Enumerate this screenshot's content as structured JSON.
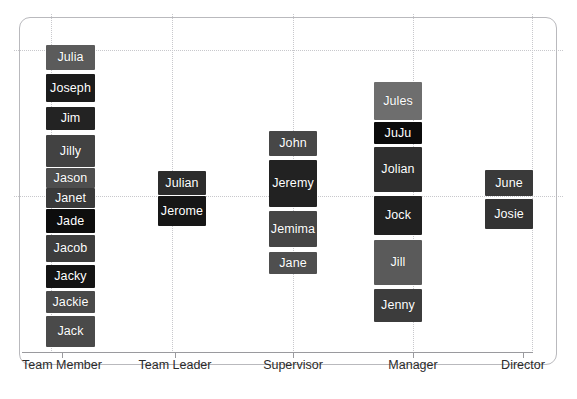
{
  "chart_data": {
    "type": "scatter",
    "title": "",
    "subtitle": "",
    "xlabel": "",
    "ylabel": "",
    "legend": [],
    "grid": true,
    "categories": [
      "Team Member",
      "Team Leader",
      "Supervisor",
      "Manager",
      "Director"
    ],
    "x_tick_positions_px": [
      62,
      175,
      293,
      413,
      523
    ],
    "gridlines": {
      "vertical_px": [
        51,
        172,
        293,
        413,
        532
      ],
      "horizontal_px": [
        50,
        196
      ]
    },
    "point_label_style": "dark filled boxes with white text",
    "series": [
      {
        "name": "Team Member",
        "category": "Team Member",
        "x_px": 71,
        "points": [
          {
            "label": "Julia",
            "x_px": 71,
            "y_px": 58,
            "box": {
              "left": 46,
              "top": 45,
              "width": 49,
              "height": 25
            },
            "color": "#5b5b5b"
          },
          {
            "label": "Joseph",
            "x_px": 71,
            "y_px": 88,
            "box": {
              "left": 46,
              "top": 74,
              "width": 49,
              "height": 28
            },
            "color": "#1c1c1c"
          },
          {
            "label": "Jim",
            "x_px": 71,
            "y_px": 119,
            "box": {
              "left": 46,
              "top": 107,
              "width": 49,
              "height": 23
            },
            "color": "#232323"
          },
          {
            "label": "Jilly",
            "x_px": 71,
            "y_px": 152,
            "box": {
              "left": 46,
              "top": 135,
              "width": 49,
              "height": 32
            },
            "color": "#424242"
          },
          {
            "label": "Jason",
            "x_px": 71,
            "y_px": 178,
            "box": {
              "left": 46,
              "top": 168,
              "width": 49,
              "height": 20
            },
            "color": "#4e4e4e"
          },
          {
            "label": "Janet",
            "x_px": 71,
            "y_px": 197,
            "box": {
              "left": 46,
              "top": 188,
              "width": 49,
              "height": 20
            },
            "color": "#3a3a3a"
          },
          {
            "label": "Jade",
            "x_px": 71,
            "y_px": 221,
            "box": {
              "left": 46,
              "top": 209,
              "width": 49,
              "height": 24
            },
            "color": "#0d0d0d"
          },
          {
            "label": "Jacob",
            "x_px": 71,
            "y_px": 249,
            "box": {
              "left": 46,
              "top": 235,
              "width": 49,
              "height": 27
            },
            "color": "#3d3d3d"
          },
          {
            "label": "Jacky",
            "x_px": 71,
            "y_px": 277,
            "box": {
              "left": 46,
              "top": 265,
              "width": 49,
              "height": 23
            },
            "color": "#141414"
          },
          {
            "label": "Jackie",
            "x_px": 71,
            "y_px": 302,
            "box": {
              "left": 46,
              "top": 291,
              "width": 49,
              "height": 22
            },
            "color": "#4a4a4a"
          },
          {
            "label": "Jack",
            "x_px": 71,
            "y_px": 332,
            "box": {
              "left": 46,
              "top": 316,
              "width": 49,
              "height": 31
            },
            "color": "#4a4a4a"
          }
        ]
      },
      {
        "name": "Team Leader",
        "category": "Team Leader",
        "x_px": 182,
        "points": [
          {
            "label": "Julian",
            "x_px": 182,
            "y_px": 183,
            "box": {
              "left": 158,
              "top": 171,
              "width": 48,
              "height": 24
            },
            "color": "#2c2c2c"
          },
          {
            "label": "Jerome",
            "x_px": 182,
            "y_px": 211,
            "box": {
              "left": 158,
              "top": 196,
              "width": 48,
              "height": 30
            },
            "color": "#161616"
          }
        ]
      },
      {
        "name": "Supervisor",
        "category": "Supervisor",
        "x_px": 293,
        "points": [
          {
            "label": "John",
            "x_px": 293,
            "y_px": 144,
            "box": {
              "left": 269,
              "top": 131,
              "width": 48,
              "height": 25
            },
            "color": "#474747"
          },
          {
            "label": "Jeremy",
            "x_px": 293,
            "y_px": 184,
            "box": {
              "left": 269,
              "top": 160,
              "width": 48,
              "height": 47
            },
            "color": "#222222"
          },
          {
            "label": "Jemima",
            "x_px": 293,
            "y_px": 229,
            "box": {
              "left": 269,
              "top": 211,
              "width": 48,
              "height": 36
            },
            "color": "#454545"
          },
          {
            "label": "Jane",
            "x_px": 293,
            "y_px": 263,
            "box": {
              "left": 269,
              "top": 252,
              "width": 48,
              "height": 22
            },
            "color": "#4f4f4f"
          }
        ]
      },
      {
        "name": "Manager",
        "category": "Manager",
        "x_px": 398,
        "points": [
          {
            "label": "Jules",
            "x_px": 398,
            "y_px": 101,
            "box": {
              "left": 374,
              "top": 82,
              "width": 48,
              "height": 38
            },
            "color": "#6e6e6e"
          },
          {
            "label": "JuJu",
            "x_px": 398,
            "y_px": 133,
            "box": {
              "left": 374,
              "top": 122,
              "width": 48,
              "height": 22
            },
            "color": "#0b0b0b"
          },
          {
            "label": "Jolian",
            "x_px": 398,
            "y_px": 170,
            "box": {
              "left": 374,
              "top": 147,
              "width": 48,
              "height": 45
            },
            "color": "#2f2f2f"
          },
          {
            "label": "Jock",
            "x_px": 398,
            "y_px": 215,
            "box": {
              "left": 374,
              "top": 196,
              "width": 48,
              "height": 39
            },
            "color": "#212121"
          },
          {
            "label": "Jill",
            "x_px": 398,
            "y_px": 263,
            "box": {
              "left": 374,
              "top": 240,
              "width": 48,
              "height": 45
            },
            "color": "#5a5a5a"
          },
          {
            "label": "Jenny",
            "x_px": 398,
            "y_px": 306,
            "box": {
              "left": 374,
              "top": 289,
              "width": 48,
              "height": 33
            },
            "color": "#3c3c3c"
          }
        ]
      },
      {
        "name": "Director",
        "category": "Director",
        "x_px": 509,
        "points": [
          {
            "label": "June",
            "x_px": 509,
            "y_px": 183,
            "box": {
              "left": 485,
              "top": 170,
              "width": 48,
              "height": 26
            },
            "color": "#3a3a3a"
          },
          {
            "label": "Josie",
            "x_px": 509,
            "y_px": 214,
            "box": {
              "left": 485,
              "top": 199,
              "width": 48,
              "height": 30
            },
            "color": "#333333"
          }
        ]
      }
    ]
  },
  "axis": {
    "ticks": [
      {
        "label": "Team Member",
        "x_px": 62
      },
      {
        "label": "Team Leader",
        "x_px": 175
      },
      {
        "label": "Supervisor",
        "x_px": 293
      },
      {
        "label": "Manager",
        "x_px": 413
      },
      {
        "label": "Director",
        "x_px": 523
      }
    ]
  },
  "colors": {
    "panel_border": "#b9b9bd",
    "grid": "#c8c8cc",
    "axis": "#9a9a9e",
    "axis_text": "#2b2b2b",
    "label_text": "#ffffff",
    "background": "#ffffff"
  }
}
